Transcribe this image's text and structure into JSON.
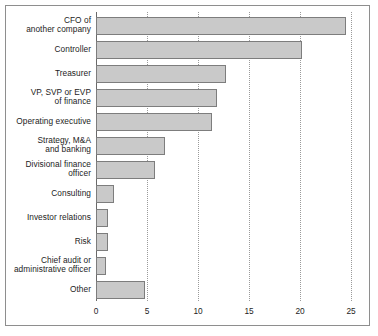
{
  "chart_data": {
    "type": "bar",
    "orientation": "horizontal",
    "title": "",
    "subtitle": "",
    "xlabel": "",
    "ylabel": "",
    "xlim": [
      0,
      25
    ],
    "xticks": [
      0,
      5,
      10,
      15,
      20,
      25
    ],
    "xtick_labels": [
      "0",
      "5",
      "10",
      "15",
      "20",
      "25"
    ],
    "grid": "vertical-dotted",
    "legend": "none",
    "bar_color": "#c9c9c9",
    "bar_border_color": "#7d7d7d",
    "axis_color": "#6a6a6a",
    "frame_color": "#8e8e8e",
    "categories": [
      "CFO of\nanother company",
      "Controller",
      "Treasurer",
      "VP, SVP or EVP\nof finance",
      "Operating executive",
      "Strategy, M&A\nand banking",
      "Divisional finance\nofficer",
      "Consulting",
      "Investor relations",
      "Risk",
      "Chief audit or\nadministrative officer",
      "Other"
    ],
    "values": [
      24.5,
      20.2,
      12.7,
      11.9,
      11.4,
      6.8,
      5.8,
      1.8,
      1.2,
      1.2,
      1.0,
      4.8
    ]
  },
  "axis": {
    "ticks": [
      {
        "value": 0,
        "label": "0"
      },
      {
        "value": 5,
        "label": "5"
      },
      {
        "value": 10,
        "label": "10"
      },
      {
        "value": 15,
        "label": "15"
      },
      {
        "value": 20,
        "label": "20"
      },
      {
        "value": 25,
        "label": "25"
      }
    ]
  },
  "rows": [
    {
      "label_line1": "CFO of",
      "label_line2": "another company",
      "value": 24.5
    },
    {
      "label_line1": "Controller",
      "label_line2": "",
      "value": 20.2
    },
    {
      "label_line1": "Treasurer",
      "label_line2": "",
      "value": 12.7
    },
    {
      "label_line1": "VP, SVP or EVP",
      "label_line2": "of finance",
      "value": 11.9
    },
    {
      "label_line1": "Operating executive",
      "label_line2": "",
      "value": 11.4
    },
    {
      "label_line1": "Strategy, M&A",
      "label_line2": "and banking",
      "value": 6.8
    },
    {
      "label_line1": "Divisional finance",
      "label_line2": "officer",
      "value": 5.8
    },
    {
      "label_line1": "Consulting",
      "label_line2": "",
      "value": 1.8
    },
    {
      "label_line1": "Investor relations",
      "label_line2": "",
      "value": 1.2
    },
    {
      "label_line1": "Risk",
      "label_line2": "",
      "value": 1.2
    },
    {
      "label_line1": "Chief audit or",
      "label_line2": "administrative officer",
      "value": 1.0
    },
    {
      "label_line1": "Other",
      "label_line2": "",
      "value": 4.8
    }
  ]
}
